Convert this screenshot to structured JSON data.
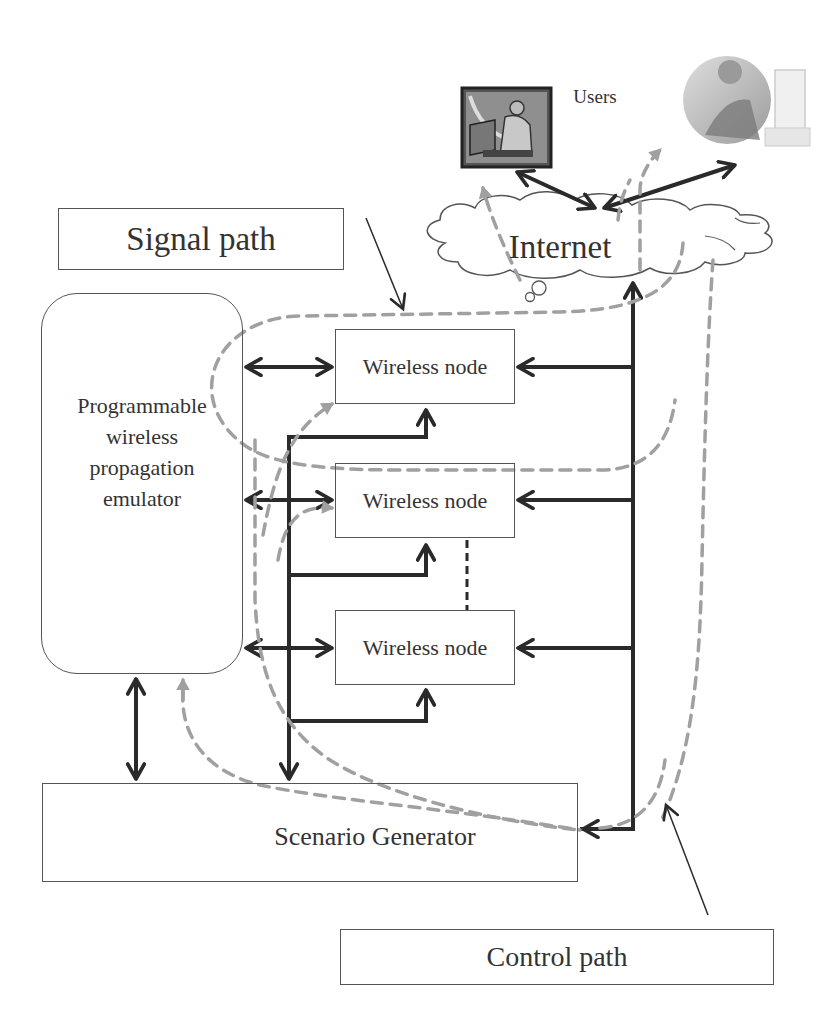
{
  "diagram": {
    "labels": {
      "users": "Users",
      "internet": "Internet",
      "signal_path": "Signal path",
      "control_path": "Control path",
      "emulator": "Programmable wireless propagation emulator",
      "emulator_lines": [
        "Programmable",
        "wireless",
        "propagation",
        "emulator"
      ],
      "scenario_generator": "Scenario Generator"
    },
    "nodes": [
      {
        "label": "Wireless node"
      },
      {
        "label": "Wireless node"
      },
      {
        "label": "Wireless node"
      }
    ],
    "icons": {
      "user_1": "user-at-computer-icon",
      "user_2": "user-at-computer-icon",
      "cloud": "cloud-icon"
    },
    "legend": {
      "signal_path_style": "solid black arrows",
      "control_path_style": "dashed gray arrows"
    },
    "colors": {
      "signal": "#2a2a2a",
      "control": "#a0a0a0",
      "box_border": "#555555",
      "text": "#333333",
      "background": "#ffffff"
    }
  }
}
